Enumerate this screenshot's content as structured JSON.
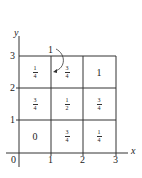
{
  "diagram": {
    "axes": {
      "x_label": "x",
      "y_label": "y",
      "origin_label": "0",
      "x_ticks": [
        "1",
        "2",
        "3"
      ],
      "y_ticks": [
        "1",
        "2",
        "3"
      ]
    },
    "top_label": "1",
    "grid": {
      "rows": [
        [
          {
            "num": "1",
            "den": "4"
          },
          {
            "num": "3",
            "den": "4"
          },
          {
            "whole": "1"
          }
        ],
        [
          {
            "num": "3",
            "den": "4"
          },
          {
            "num": "1",
            "den": "2"
          },
          {
            "num": "3",
            "den": "4"
          }
        ],
        [
          {
            "whole": "0"
          },
          {
            "num": "3",
            "den": "4"
          },
          {
            "num": "1",
            "den": "4"
          }
        ]
      ]
    },
    "colors": {
      "line": "#333333",
      "background": "#ffffff"
    }
  }
}
